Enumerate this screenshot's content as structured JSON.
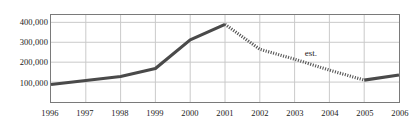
{
  "chart_data": {
    "type": "line",
    "title": "",
    "xlabel": "",
    "ylabel": "",
    "x": [
      1996,
      1997,
      1998,
      1999,
      2000,
      2001,
      2002,
      2003,
      2004,
      2005,
      2006
    ],
    "xtick_labels": [
      "1996",
      "1997",
      "1998",
      "1999",
      "2000",
      "2001",
      "2002",
      "2003",
      "2004",
      "2005",
      "2006"
    ],
    "ytick_labels": [
      "100,000",
      "200,000",
      "300,000",
      "400,000"
    ],
    "ytick_values": [
      100000,
      200000,
      300000,
      400000
    ],
    "xlim": [
      1996,
      2006
    ],
    "ylim": [
      0,
      437000
    ],
    "grid": true,
    "legend": false,
    "series": [
      {
        "name": "actual",
        "style": "solid",
        "color": "#4a4a4a",
        "x": [
          1996,
          1997,
          1998,
          1999,
          2000,
          2001
        ],
        "values": [
          88000,
          108000,
          128000,
          168000,
          312000,
          390000
        ]
      },
      {
        "name": "estimated",
        "style": "dotted",
        "color": "#555555",
        "x": [
          2001,
          2002,
          2003,
          2004,
          2005
        ],
        "values": [
          390000,
          265000,
          215000,
          160000,
          110000
        ]
      },
      {
        "name": "actual-recovery",
        "style": "solid",
        "color": "#4a4a4a",
        "x": [
          2005,
          2006
        ],
        "values": [
          110000,
          136000
        ]
      }
    ],
    "annotations": [
      {
        "text": "est.",
        "x": 2003.25,
        "y": 243000
      }
    ]
  },
  "colors": {
    "grid": "#c9c9c9",
    "frame": "#7a7a7a",
    "line": "#4a4a4a",
    "text": "#1a1a1a",
    "background": "#ffffff"
  }
}
